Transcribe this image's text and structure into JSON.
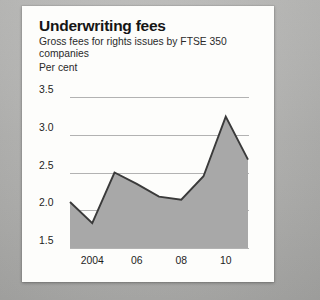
{
  "card": {
    "title": "Underwriting fees",
    "subtitle": "Gross fees for rights issues by FTSE 350 companies",
    "units": "Per cent"
  },
  "colors": {
    "card_background": "#fdfdfb",
    "page_background": "#b9b9b7",
    "area_fill": "#a8a8a8",
    "area_line": "#3a3a3a",
    "gridline": "#b2b2b2",
    "text": "#151515"
  },
  "chart_data": {
    "type": "area",
    "title": "Underwriting fees",
    "subtitle": "Gross fees for rights issues by FTSE 350 companies",
    "xlabel": "",
    "ylabel": "Per cent",
    "ylim": [
      1.5,
      3.5
    ],
    "xlim": [
      2003,
      2011
    ],
    "grid": true,
    "legend": "none",
    "y_ticks": [
      "1.5",
      "2.0",
      "2.5",
      "3.0",
      "3.5"
    ],
    "y_tick_values": [
      1.5,
      2.0,
      2.5,
      3.0,
      3.5
    ],
    "x_ticks": [
      "2004",
      "06",
      "08",
      "10"
    ],
    "x_tick_values": [
      2004,
      2006,
      2008,
      2010
    ],
    "x": [
      2003,
      2004,
      2005,
      2006,
      2007,
      2008,
      2009,
      2010,
      2011
    ],
    "values": [
      2.11,
      1.83,
      2.5,
      2.35,
      2.18,
      2.14,
      2.45,
      3.24,
      2.67
    ],
    "series": [
      {
        "name": "Gross fees for rights issues by FTSE 350 companies",
        "values": [
          2.11,
          1.83,
          2.5,
          2.35,
          2.18,
          2.14,
          2.45,
          3.24,
          2.67
        ]
      }
    ]
  }
}
